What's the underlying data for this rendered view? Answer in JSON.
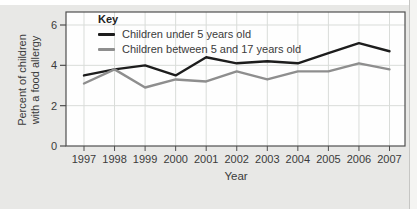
{
  "panel": {
    "background_color": "#e8e8e6",
    "plot_background_color": "#fefefe",
    "axis_color": "#4f4f4f",
    "grid_color": "#d9dcd9",
    "text_color": "#3b3b3b"
  },
  "legend": {
    "title": "Key"
  },
  "chart_data": {
    "type": "line",
    "title": "",
    "xlabel": "Year",
    "ylabel": "Percent of children with a food allergy",
    "ylabel_lines": [
      "Percent of children",
      "with a food allergy"
    ],
    "x": [
      1997,
      1998,
      1999,
      2000,
      2001,
      2002,
      2003,
      2004,
      2005,
      2006,
      2007
    ],
    "yticks": [
      0,
      2,
      4,
      6
    ],
    "ylim": [
      0,
      6.65
    ],
    "grid": true,
    "legend_position": "top-left-inside",
    "series": [
      {
        "name": "Children under 5 years old",
        "color": "#1d1d1d",
        "values": [
          3.5,
          3.8,
          4.0,
          3.5,
          4.4,
          4.1,
          4.2,
          4.1,
          4.6,
          5.1,
          4.7
        ]
      },
      {
        "name": "Children between 5 and 17 years old",
        "color": "#8e8e8e",
        "values": [
          3.1,
          3.8,
          2.9,
          3.3,
          3.2,
          3.7,
          3.3,
          3.7,
          3.7,
          4.1,
          3.8
        ]
      }
    ]
  }
}
